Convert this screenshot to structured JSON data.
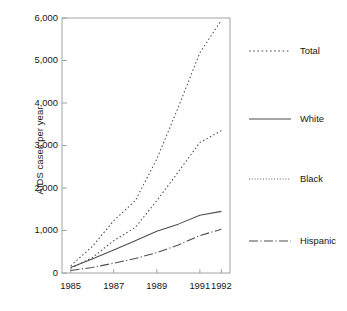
{
  "chart_data": {
    "type": "line",
    "title": "",
    "subtitle": "",
    "xlabel": "",
    "ylabel": "AIDS cases per year",
    "x": [
      1985,
      1986,
      1987,
      1988,
      1989,
      1990,
      1991,
      1992
    ],
    "xticklabels": [
      "1985",
      "1987",
      "1989",
      "1991",
      "1992"
    ],
    "xticks": [
      1985,
      1987,
      1989,
      1991,
      1992
    ],
    "xlim": [
      1984.6,
      1992.4
    ],
    "ylim": [
      0,
      6000
    ],
    "yticks": [
      0,
      1000,
      2000,
      3000,
      4000,
      5000,
      6000
    ],
    "yticklabels": [
      "0",
      "1,000",
      "2,000",
      "3,000",
      "4,000",
      "5,000",
      "6,000"
    ],
    "grid": false,
    "legend_position": "right",
    "series": [
      {
        "name": "Total",
        "style": "dotted",
        "color": "#4d4d4d",
        "values": [
          170,
          620,
          1230,
          1700,
          2680,
          3900,
          5180,
          5950
        ]
      },
      {
        "name": "White",
        "style": "solid",
        "color": "#4d4d4d",
        "values": [
          130,
          330,
          540,
          760,
          980,
          1150,
          1360,
          1450
        ]
      },
      {
        "name": "Black",
        "style": "dotted",
        "color": "#4d4d4d",
        "values": [
          110,
          360,
          760,
          1070,
          1700,
          2380,
          3070,
          3350
        ]
      },
      {
        "name": "Hispanic",
        "style": "dashdot",
        "color": "#4d4d4d",
        "values": [
          60,
          130,
          230,
          340,
          480,
          660,
          880,
          1030
        ]
      }
    ]
  },
  "legend": {
    "entries": [
      {
        "label": "Total"
      },
      {
        "label": "White"
      },
      {
        "label": "Black"
      },
      {
        "label": "Hispanic"
      }
    ]
  },
  "axis": {
    "y_title": "AIDS cases per year",
    "y_labels": [
      "6,000",
      "5,000",
      "4,000",
      "3,000",
      "2,000",
      "1,000",
      "0"
    ],
    "x_labels": [
      "1985",
      "1987",
      "1989",
      "1991",
      "1992"
    ]
  },
  "colors": {
    "line": "#4d4d4d",
    "frame": "#9a9a9a",
    "text": "#161616",
    "background": "#ffffff"
  }
}
